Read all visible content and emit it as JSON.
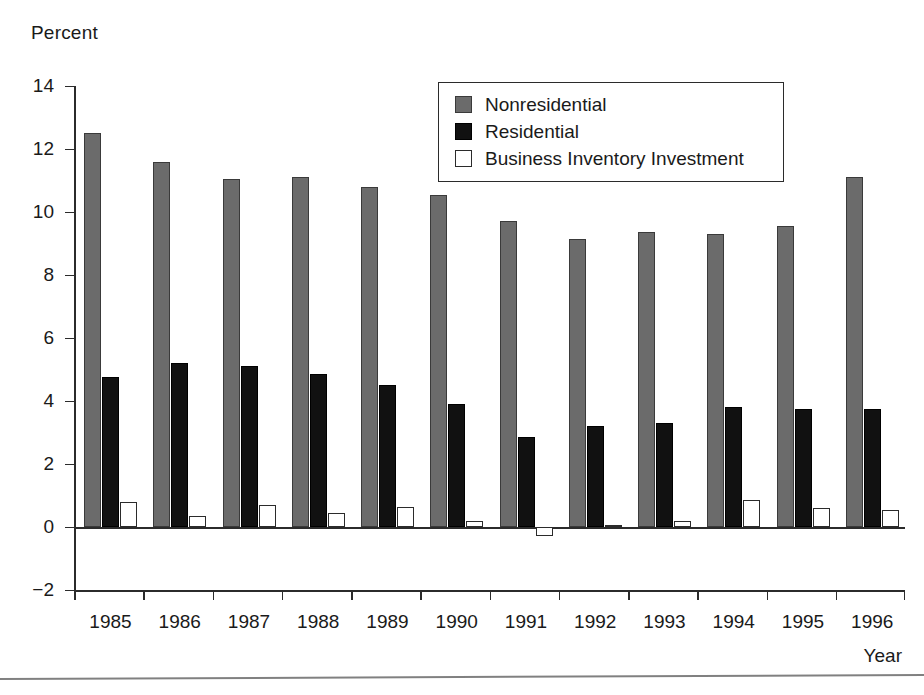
{
  "chart_data": {
    "type": "bar",
    "title": "",
    "xlabel": "Year",
    "ylabel": "Percent",
    "categories": [
      "1985",
      "1986",
      "1987",
      "1988",
      "1989",
      "1990",
      "1991",
      "1992",
      "1993",
      "1994",
      "1995",
      "1996"
    ],
    "series": [
      {
        "name": "Nonresidential",
        "color": "#6b6b6b",
        "values": [
          12.5,
          11.6,
          11.05,
          11.1,
          10.8,
          10.55,
          9.7,
          9.15,
          9.35,
          9.3,
          9.55,
          11.1
        ]
      },
      {
        "name": "Residential",
        "color": "#111111",
        "values": [
          4.75,
          5.2,
          5.1,
          4.85,
          4.5,
          3.9,
          2.85,
          3.2,
          3.3,
          3.8,
          3.75,
          3.75
        ]
      },
      {
        "name": "Business Inventory Investment",
        "color": "#ffffff",
        "values": [
          0.8,
          0.35,
          0.7,
          0.45,
          0.65,
          0.2,
          -0.3,
          0.05,
          0.2,
          0.85,
          0.6,
          0.55
        ]
      }
    ],
    "yticks": [
      14,
      12,
      10,
      8,
      6,
      4,
      2,
      0,
      -2
    ],
    "ytick_labels": [
      "14",
      "12",
      "10",
      "8",
      "6",
      "4",
      "2",
      "0",
      "−2"
    ],
    "ylim": [
      -2,
      14
    ],
    "grid": false,
    "legend_position": "top-right"
  },
  "axis": {
    "y_title": "Percent",
    "x_title": "Year"
  },
  "legend": {
    "entries": [
      {
        "label": "Nonresidential",
        "swatch": "filled-gray-swatch"
      },
      {
        "label": "Residential",
        "swatch": "filled-black-swatch"
      },
      {
        "label": "Business Inventory Investment",
        "swatch": "outline-white-swatch"
      }
    ]
  }
}
